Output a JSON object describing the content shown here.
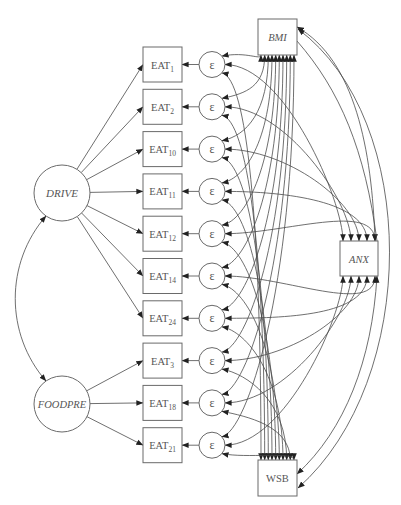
{
  "diagram": {
    "type": "structural-equation-model",
    "latent_factors": [
      {
        "id": "DRIVE",
        "label": "DRIVE",
        "cx": 62,
        "cy": 193,
        "r": 28,
        "indicators": [
          "EAT1",
          "EAT2",
          "EAT10",
          "EAT11",
          "EAT12",
          "EAT14",
          "EAT24"
        ]
      },
      {
        "id": "FOODPRE",
        "label": "FOODPRE",
        "cx": 62,
        "cy": 404,
        "r": 28,
        "indicators": [
          "EAT3",
          "EAT18",
          "EAT21"
        ]
      }
    ],
    "factor_covariance": {
      "from": "DRIVE",
      "to": "FOODPRE"
    },
    "indicators": [
      {
        "id": "EAT1",
        "base": "EAT",
        "sub": "1"
      },
      {
        "id": "EAT2",
        "base": "EAT",
        "sub": "2"
      },
      {
        "id": "EAT10",
        "base": "EAT",
        "sub": "10"
      },
      {
        "id": "EAT11",
        "base": "EAT",
        "sub": "11"
      },
      {
        "id": "EAT12",
        "base": "EAT",
        "sub": "12"
      },
      {
        "id": "EAT14",
        "base": "EAT",
        "sub": "14"
      },
      {
        "id": "EAT24",
        "base": "EAT",
        "sub": "24"
      },
      {
        "id": "EAT3",
        "base": "EAT",
        "sub": "3"
      },
      {
        "id": "EAT18",
        "base": "EAT",
        "sub": "18"
      },
      {
        "id": "EAT21",
        "base": "EAT",
        "sub": "21"
      }
    ],
    "error_label": "ε",
    "covariates": [
      {
        "id": "BMI",
        "label": "BMI",
        "x": 258,
        "y": 19,
        "w": 39,
        "h": 36,
        "italic": true
      },
      {
        "id": "ANX",
        "label": "ANX",
        "x": 340,
        "y": 241,
        "w": 38,
        "h": 35,
        "italic": true
      },
      {
        "id": "WSB",
        "label": "WSB",
        "x": 258,
        "y": 460,
        "w": 39,
        "h": 36,
        "italic": false
      }
    ],
    "covariate_links": [
      {
        "from": "BMI",
        "to": "ANX"
      },
      {
        "from": "BMI",
        "to": "WSB"
      },
      {
        "from": "ANX",
        "to": "WSB"
      }
    ],
    "colors": {
      "stroke": "#4a4a4a",
      "text": "#555555",
      "background": "#ffffff"
    }
  }
}
